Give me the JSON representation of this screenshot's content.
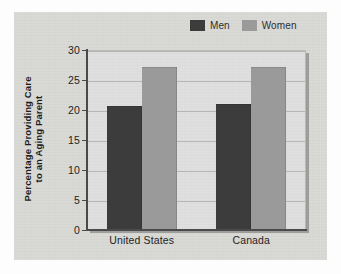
{
  "chart_data": {
    "type": "bar",
    "title": "",
    "subtitle": "",
    "xlabel": "",
    "ylabel_line1": "Percentage Providing Care",
    "ylabel_line2": "to an Aging Parent",
    "categories": [
      "United States",
      "Canada"
    ],
    "series": [
      {
        "name": "Men",
        "values": [
          20.7,
          21.0
        ],
        "color": "#3c3c3c"
      },
      {
        "name": "Women",
        "values": [
          27.1,
          27.1
        ],
        "color": "#9a9a9a"
      }
    ],
    "ylim": [
      0,
      30
    ],
    "yticks": [
      0,
      5,
      10,
      15,
      20,
      25,
      30
    ],
    "ytick_labels": [
      "0",
      "5",
      "10",
      "15",
      "20",
      "25",
      "30"
    ],
    "grid": true,
    "grid_axis": "y",
    "legend_position": "top-right",
    "plot_background": "#dedede",
    "figure_background": "#d8d8d5"
  },
  "legend": {
    "items": [
      {
        "label": "Men",
        "swatch_name": "legend-swatch-men"
      },
      {
        "label": "Women",
        "swatch_name": "legend-swatch-women"
      }
    ]
  }
}
